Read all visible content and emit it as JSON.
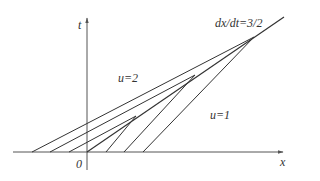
{
  "labels": {
    "t_axis": "t",
    "x_axis": "x",
    "origin": "0",
    "left_state": "u=2",
    "right_state": "u=1",
    "shock_speed": "dx/dt=3/2"
  },
  "colors": {
    "line": "#333333",
    "axis": "#555555",
    "background": "#ffffff"
  },
  "geometry": {
    "x_axis": {
      "x1": 13,
      "y1": 152,
      "x2": 283,
      "y2": 152
    },
    "t_axis": {
      "x1": 87,
      "y1": 170,
      "x2": 87,
      "y2": 18
    },
    "shock": {
      "x1": 87,
      "y1": 152,
      "x2": 284,
      "y2": 17
    },
    "characteristics_left_u2": [
      {
        "x1": 69,
        "y1": 152,
        "x2": 136,
        "y2": 116
      },
      {
        "x1": 50,
        "y1": 152,
        "x2": 195,
        "y2": 75
      },
      {
        "x1": 32,
        "y1": 152,
        "x2": 254,
        "y2": 37
      }
    ],
    "characteristics_right_u1": [
      {
        "x1": 106,
        "y1": 152,
        "x2": 136,
        "y2": 116
      },
      {
        "x1": 124,
        "y1": 152,
        "x2": 195,
        "y2": 75
      },
      {
        "x1": 143,
        "y1": 152,
        "x2": 254,
        "y2": 37
      }
    ]
  }
}
